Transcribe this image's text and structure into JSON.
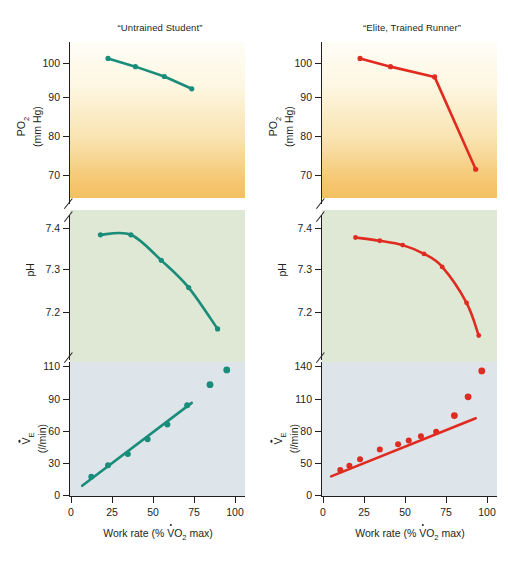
{
  "figure": {
    "panel_titles": {
      "left": "“Untrained Student”",
      "right": "“Elite, Trained Runner”"
    },
    "x_axis_label_parts": {
      "pre": "Work rate (% ",
      "v": "V",
      "o": "O",
      "sub": "2",
      "post": " max)"
    },
    "colors": {
      "untrained": "#1a8c7a",
      "elite": "#e02b20",
      "po2_band_top": "#fefdf6",
      "po2_band_bottom": "#f3c063",
      "ph_band": "#dfe8d4",
      "ve_band": "#dde4ea",
      "axis": "#231f20"
    }
  },
  "chart_data": [
    {
      "type": "line",
      "id": "po2-untrained",
      "title": "“Untrained Student”",
      "xlabel": "Work rate (% VO2 max)",
      "ylabel": "PO2 (mm Hg)",
      "ylabel_line1": "PO",
      "ylabel_line1_sub": "2",
      "ylabel_line2": "(mm Hg)",
      "series_name": "Untrained Student",
      "color": "#1a8c7a",
      "xlim": [
        0,
        115
      ],
      "ylim": [
        66,
        104
      ],
      "yticks": [
        70,
        80,
        90,
        100
      ],
      "ytick_labels": [
        "70",
        "80",
        "90",
        "100"
      ],
      "axis_break": true,
      "x": [
        25,
        43,
        62,
        80
      ],
      "y": [
        100.0,
        98.0,
        95.6,
        92.6
      ]
    },
    {
      "type": "line",
      "id": "po2-elite",
      "title": "“Elite, Trained Runner”",
      "xlabel": "Work rate (% VO2 max)",
      "ylabel": "PO2 (mm Hg)",
      "ylabel_line1": "PO",
      "ylabel_line1_sub": "2",
      "ylabel_line2": "(mm Hg)",
      "series_name": "Elite, Trained Runner",
      "color": "#e02b20",
      "xlim": [
        0,
        115
      ],
      "ylim": [
        66,
        104
      ],
      "yticks": [
        70,
        80,
        90,
        100
      ],
      "ytick_labels": [
        "70",
        "80",
        "90",
        "100"
      ],
      "axis_break": true,
      "x": [
        25,
        45,
        74,
        101
      ],
      "y": [
        100.0,
        98.0,
        95.5,
        73.0
      ]
    },
    {
      "type": "line",
      "id": "ph-untrained",
      "ylabel": "pH",
      "series_name": "Untrained Student",
      "color": "#1a8c7a",
      "xlim": [
        0,
        115
      ],
      "ylim": [
        7.175,
        7.445
      ],
      "yticks": [
        7.2,
        7.3,
        7.4
      ],
      "ytick_labels": [
        "7.2",
        "7.3",
        "7.4"
      ],
      "axis_break": true,
      "x": [
        20,
        40,
        60,
        78,
        97
      ],
      "y": [
        7.405,
        7.405,
        7.358,
        7.308,
        7.232
      ]
    },
    {
      "type": "line",
      "id": "ph-elite",
      "ylabel": "pH",
      "series_name": "Elite, Trained Runner",
      "color": "#e02b20",
      "xlim": [
        0,
        115
      ],
      "ylim": [
        7.175,
        7.445
      ],
      "yticks": [
        7.2,
        7.3,
        7.4
      ],
      "ytick_labels": [
        "7.2",
        "7.3",
        "7.4"
      ],
      "axis_break": true,
      "x": [
        22,
        38,
        53,
        67,
        79,
        95,
        103
      ],
      "y": [
        7.4,
        7.394,
        7.386,
        7.37,
        7.346,
        7.28,
        7.22
      ]
    },
    {
      "type": "scatter",
      "id": "ve-untrained",
      "xlabel": "Work rate (% VO2 max)",
      "ylabel": "VE (l/min)",
      "ylabel_line1": "V",
      "ylabel_line1_sub": "E",
      "ylabel_line2": "( /min)",
      "series_name": "Untrained Student",
      "color": "#1a8c7a",
      "xlim": [
        0,
        115
      ],
      "ylim": [
        0,
        118
      ],
      "yticks": [
        0,
        30,
        60,
        90,
        110
      ],
      "ytick_labels": [
        "0",
        "30",
        "60",
        "90",
        "110"
      ],
      "xticks": [
        0,
        25,
        50,
        75,
        100
      ],
      "xtick_labels": [
        "0",
        "25",
        "50",
        "75",
        "100"
      ],
      "fit_line": {
        "x": [
          8,
          80
        ],
        "y": [
          9,
          82
        ]
      },
      "on_line_x": [
        14,
        25,
        38,
        51,
        64,
        77
      ],
      "on_line_y": [
        17,
        27,
        37,
        50,
        63,
        80
      ],
      "off_line_x": [
        92,
        103
      ],
      "off_line_y": [
        98,
        111
      ]
    },
    {
      "type": "scatter",
      "id": "ve-elite",
      "xlabel": "Work rate (% VO2 max)",
      "ylabel": "VE (l/min)",
      "ylabel_line1": "V",
      "ylabel_line1_sub": "E",
      "ylabel_line2": "( /min)",
      "series_name": "Elite, Trained Runner",
      "color": "#e02b20",
      "xlim": [
        0,
        115
      ],
      "ylim": [
        0,
        150
      ],
      "yticks": [
        0,
        50,
        80,
        110,
        140
      ],
      "ytick_labels": [
        "0",
        "50",
        "80",
        "110",
        "140"
      ],
      "xticks": [
        0,
        25,
        50,
        75,
        100
      ],
      "xtick_labels": [
        "0",
        "25",
        "50",
        "75",
        "100"
      ],
      "fit_line": {
        "x": [
          6,
          101
        ],
        "y": [
          22,
          87
        ]
      },
      "on_line_x": [
        12,
        18,
        25,
        38,
        50,
        57,
        65,
        75
      ],
      "on_line_y": [
        29,
        34,
        41,
        52,
        58,
        62,
        67,
        72
      ],
      "off_line_x": [
        87,
        96,
        105
      ],
      "off_line_y": [
        90,
        111,
        140
      ]
    }
  ]
}
